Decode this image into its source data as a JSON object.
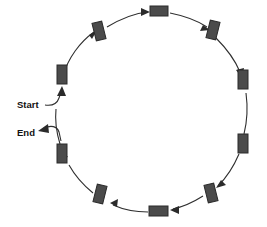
{
  "diagram": {
    "type": "cycle",
    "title_fragment": "",
    "node_count": 10,
    "flow_direction": "clockwise",
    "colors": {
      "node_fill": "#4b4b4b",
      "node_stroke": "#2b2b2b",
      "arc_stroke": "#2f2f2f",
      "label_text": "#111111",
      "background": "#ffffff"
    },
    "labels": {
      "start": "Start",
      "end": "End"
    },
    "nodes": [
      {
        "id": "node-1",
        "angle_deg": 270,
        "orientation": "horizontal"
      },
      {
        "id": "node-2",
        "angle_deg": 306,
        "orientation": "vertical"
      },
      {
        "id": "node-3",
        "angle_deg": 342,
        "orientation": "vertical"
      },
      {
        "id": "node-4",
        "angle_deg": 18,
        "orientation": "vertical"
      },
      {
        "id": "node-5",
        "angle_deg": 54,
        "orientation": "vertical"
      },
      {
        "id": "node-6",
        "angle_deg": 90,
        "orientation": "horizontal"
      },
      {
        "id": "node-7",
        "angle_deg": 126,
        "orientation": "vertical"
      },
      {
        "id": "node-8",
        "angle_deg": 162,
        "orientation": "vertical"
      },
      {
        "id": "node-9",
        "angle_deg": 210,
        "orientation": "vertical"
      },
      {
        "id": "node-10",
        "angle_deg": 234,
        "orientation": "vertical"
      }
    ]
  }
}
